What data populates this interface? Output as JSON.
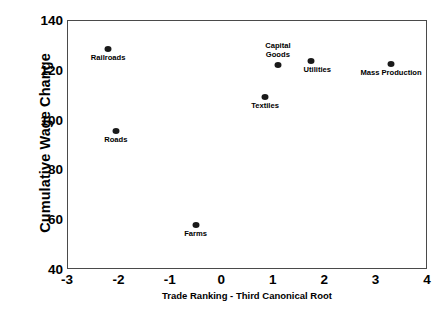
{
  "chart_data": {
    "type": "scatter",
    "title": "",
    "xlabel": "Trade Ranking - Third Canonical Root",
    "ylabel": "Cumulative Wage Change",
    "xlim": [
      -3,
      4
    ],
    "ylim": [
      40,
      140
    ],
    "xticks": [
      "-3",
      "-2",
      "-1",
      "0",
      "1",
      "2",
      "3",
      "4"
    ],
    "yticks": [
      "40",
      "60",
      "80",
      "100",
      "120",
      "140"
    ],
    "grid": false,
    "legend": "none",
    "points": [
      {
        "label": "Railroads",
        "x": -2.2,
        "y": 128.5,
        "label_pos": "below"
      },
      {
        "label": "Roads",
        "x": -2.05,
        "y": 95.5,
        "label_pos": "below"
      },
      {
        "label": "Farms",
        "x": -0.5,
        "y": 57.5,
        "label_pos": "below"
      },
      {
        "label": "Textiles",
        "x": 0.85,
        "y": 109.0,
        "label_pos": "below"
      },
      {
        "label": "Capital\nGoods",
        "x": 1.1,
        "y": 122.0,
        "label_pos": "above"
      },
      {
        "label": "Utilities",
        "x": 1.75,
        "y": 123.5,
        "label_pos": "below-right"
      },
      {
        "label": "Mass Production",
        "x": 3.3,
        "y": 122.5,
        "label_pos": "below"
      }
    ]
  },
  "colors": {
    "marker": "#1a1a1a",
    "frame": "#4a4a4a",
    "text": "#000000",
    "background": "#ffffff"
  }
}
